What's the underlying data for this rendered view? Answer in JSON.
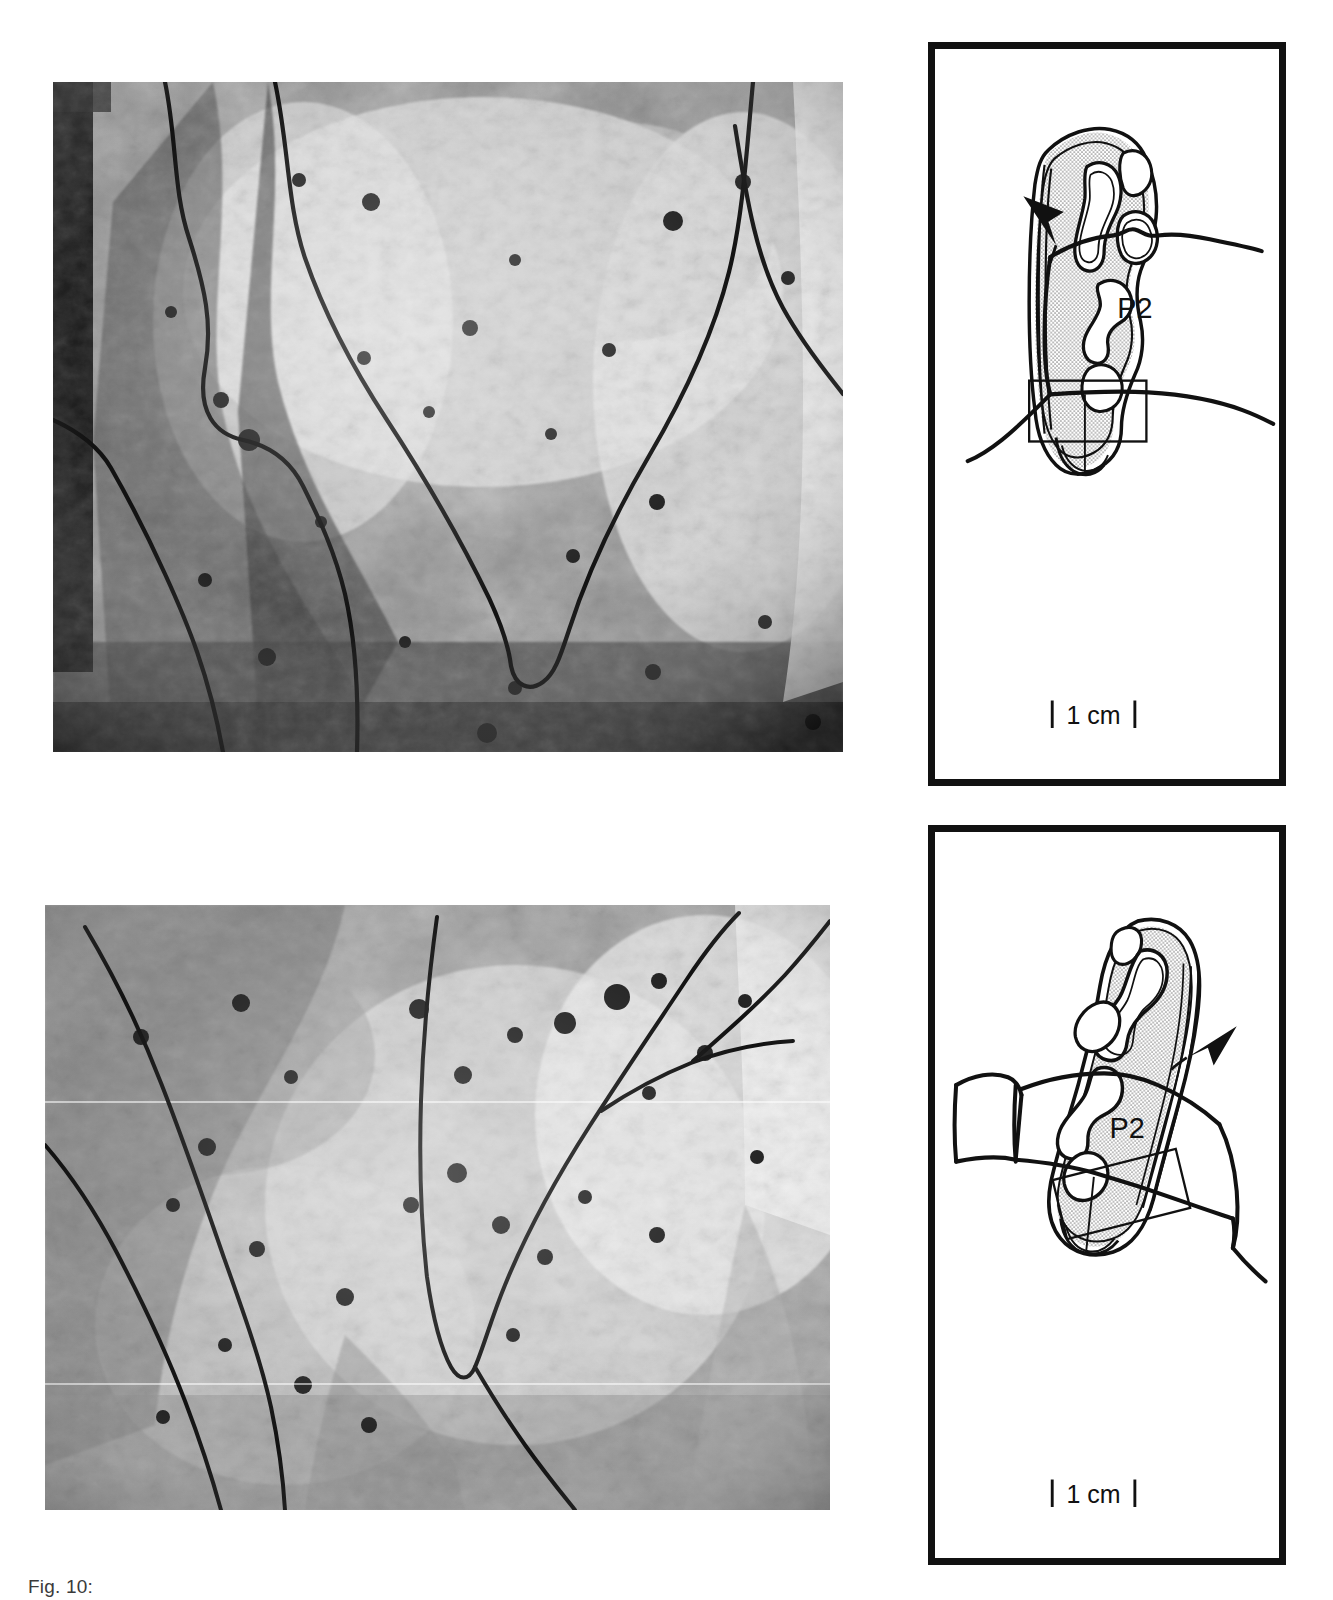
{
  "figure": {
    "caption": "Fig. 10:",
    "panel_count": 2
  },
  "panels": [
    {
      "id": "panel-a",
      "position": "top",
      "micrograph": {
        "name": "sem-micrograph-top",
        "description": "Scanning electron micrograph of tooth enamel surface with ink-traced enamel band outlines forming a V-shaped fold",
        "tone": "grayscale halftone"
      },
      "diagram": {
        "occlusal": {
          "name": "occlusal-tooth-outline-top",
          "description": "Occlusal view of cheek tooth with stippled dentine field and enamel loops",
          "stipple_fill": "#b9b9b9",
          "outline_color": "#111111",
          "inset_box": {
            "name": "inset-region-box-top",
            "rotation_deg": 0,
            "description": "Rectangle marking the region shown in the micrograph"
          }
        },
        "lateral": {
          "name": "lateral-tooth-outline-top",
          "label": "P2",
          "arrow": {
            "name": "arrowhead-marker-top",
            "direction": "down-right",
            "description": "Solid arrowhead indicating the anterolabial feature"
          }
        },
        "scalebar": {
          "name": "scale-bar-top",
          "label": "1 cm",
          "end_caps": "bracket"
        }
      }
    },
    {
      "id": "panel-b",
      "position": "bottom",
      "micrograph": {
        "name": "sem-micrograph-bottom",
        "description": "Scanning electron micrograph of tooth enamel surface with ink-traced enamel band outlines forming a V-shaped fold, lighter exposure",
        "tone": "grayscale halftone"
      },
      "diagram": {
        "occlusal": {
          "name": "occlusal-tooth-outline-bottom",
          "description": "Occlusal view of cheek tooth, mirrored orientation, with stippled dentine field and enamel loops",
          "stipple_fill": "#b9b9b9",
          "outline_color": "#111111",
          "inset_box": {
            "name": "inset-region-box-bottom",
            "rotation_deg": -14,
            "description": "Tilted rectangle marking the region shown in the micrograph"
          }
        },
        "lateral": {
          "name": "lateral-tooth-outline-bottom",
          "label": "P2",
          "arrow": {
            "name": "arrowhead-marker-bottom",
            "direction": "down-left",
            "description": "Solid arrowhead indicating the posterolabial feature"
          }
        },
        "scalebar": {
          "name": "scale-bar-bottom",
          "label": "1 cm",
          "end_caps": "bracket"
        }
      }
    }
  ],
  "colors": {
    "ink": "#111111",
    "page": "#ffffff",
    "stipple": "#b9b9b9",
    "caption_text": "#3a3a3a"
  }
}
